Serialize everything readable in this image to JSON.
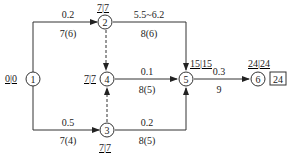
{
  "diagram": {
    "type": "activity-on-arrow network",
    "nodes": [
      {
        "id": "1",
        "x": 33,
        "y": 79,
        "label": "0|0",
        "label_pos": "left"
      },
      {
        "id": "2",
        "x": 105,
        "y": 22,
        "label": "7|7",
        "label_pos": "top"
      },
      {
        "id": "4",
        "x": 107,
        "y": 79,
        "label": "7|7",
        "label_pos": "left"
      },
      {
        "id": "3",
        "x": 107,
        "y": 130,
        "label": "7|7",
        "label_pos": "bottom"
      },
      {
        "id": "5",
        "x": 186,
        "y": 79,
        "label": "15|15",
        "label_pos": "topleft"
      },
      {
        "id": "6",
        "x": 258,
        "y": 79,
        "label": "24|24",
        "label_pos": "top"
      }
    ],
    "edges": [
      {
        "from": "1",
        "to": "2",
        "top": "0.2",
        "bottom": "7(6)",
        "style": "solid"
      },
      {
        "from": "1",
        "to": "3",
        "top": "0.5",
        "bottom": "7(4)",
        "style": "solid"
      },
      {
        "from": "2",
        "to": "4",
        "top": "",
        "bottom": "",
        "style": "dashed"
      },
      {
        "from": "3",
        "to": "4",
        "top": "",
        "bottom": "",
        "style": "dashed"
      },
      {
        "from": "2",
        "to": "5",
        "top": "5.5~6.2",
        "bottom": "8(6)",
        "style": "solid"
      },
      {
        "from": "4",
        "to": "5",
        "top": "0.1",
        "bottom": "8(5)",
        "style": "solid"
      },
      {
        "from": "3",
        "to": "5",
        "top": "0.2",
        "bottom": "8(5)",
        "style": "solid"
      },
      {
        "from": "5",
        "to": "6",
        "top": "0.3",
        "bottom": "9",
        "style": "solid"
      }
    ],
    "total_duration": "24"
  }
}
